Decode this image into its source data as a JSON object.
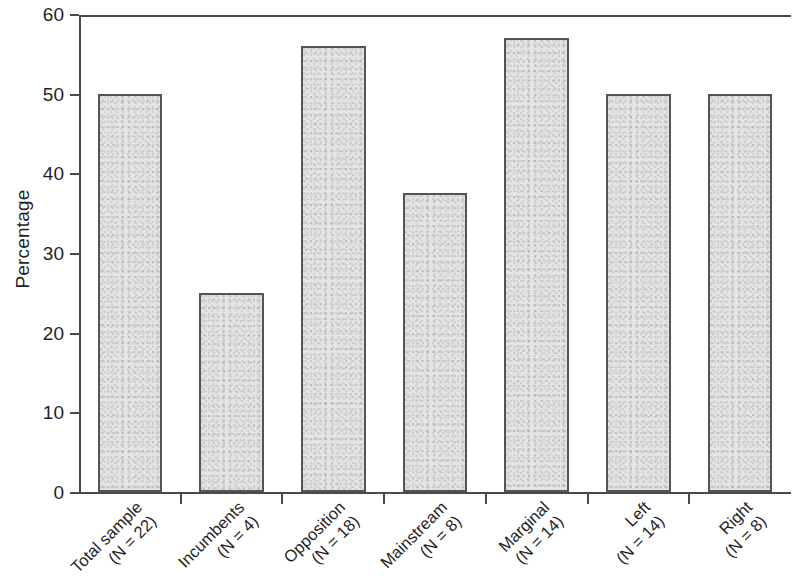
{
  "chart_data": {
    "type": "bar",
    "title": "",
    "xlabel": "",
    "ylabel": "Percentage",
    "ylim": [
      0,
      60
    ],
    "yticks": [
      0,
      10,
      20,
      30,
      40,
      50,
      60
    ],
    "ytick_labels": [
      "0",
      "10",
      "20",
      "30",
      "40",
      "50",
      "60"
    ],
    "grid": false,
    "legend": "none",
    "categories": [
      "Total sample (N = 22)",
      "Incumbents (N = 4)",
      "Opposition (N = 18)",
      "Mainstream (N = 8)",
      "Marginal (N = 14)",
      "Left (N = 14)",
      "Right (N = 8)"
    ],
    "category_lines": [
      {
        "name": "Total sample",
        "n_label": "(N = 22)"
      },
      {
        "name": "Incumbents",
        "n_label": "(N = 4)"
      },
      {
        "name": "Opposition",
        "n_label": "(N = 18)"
      },
      {
        "name": "Mainstream",
        "n_label": "(N = 8)"
      },
      {
        "name": "Marginal",
        "n_label": "(N = 14)"
      },
      {
        "name": "Left",
        "n_label": "(N = 14)"
      },
      {
        "name": "Right",
        "n_label": "(N = 8)"
      }
    ],
    "values": [
      50,
      25,
      56,
      37.5,
      57,
      50,
      50
    ],
    "bar_color": "#e4e4e4",
    "bar_edge_color": "#545454",
    "axis_color": "#4a4a4a"
  }
}
